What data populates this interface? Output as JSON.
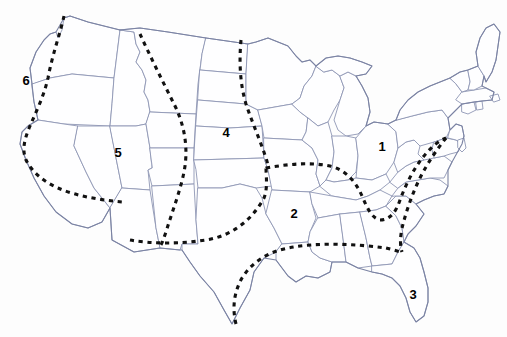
{
  "map": {
    "title": "United States regional division map",
    "background_color": "#fdfdfd",
    "state_border_color": "#8e96b4",
    "outline_color": "#7b83a3",
    "divider_color": "#111111",
    "divider_style": "dashed",
    "label_color": "#000000",
    "width": 507,
    "height": 337
  },
  "regions": [
    {
      "id": "region-1",
      "label": "1",
      "x": 382,
      "y": 146,
      "area": "east-central"
    },
    {
      "id": "region-2",
      "label": "2",
      "x": 294,
      "y": 213,
      "area": "south-central"
    },
    {
      "id": "region-3",
      "label": "3",
      "x": 413,
      "y": 294,
      "area": "southeast-peninsula"
    },
    {
      "id": "region-4",
      "label": "4",
      "x": 226,
      "y": 132,
      "area": "north-central"
    },
    {
      "id": "region-5",
      "label": "5",
      "x": 118,
      "y": 152,
      "area": "interior-west"
    },
    {
      "id": "region-6",
      "label": "6",
      "x": 26,
      "y": 80,
      "area": "northwest-coast"
    }
  ]
}
